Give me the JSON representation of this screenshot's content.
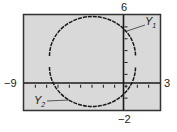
{
  "chart_data": {
    "type": "line",
    "title": "",
    "xlabel": "",
    "ylabel": "",
    "xlim": [
      -9,
      3
    ],
    "ylim": [
      -2,
      6
    ],
    "xscale": 1,
    "yscale": 1,
    "grid": false,
    "series": [
      {
        "name": "Y1",
        "description": "upper semicircle",
        "equation": "y = 2 + sqrt(16 - (x + 3)^2)"
      },
      {
        "name": "Y2",
        "description": "lower semicircle",
        "equation": "y = 2 - sqrt(16 - (x + 3)^2)"
      }
    ],
    "circle": {
      "center": [
        -3,
        2
      ],
      "radius": 4
    }
  },
  "labels": {
    "xmin": "−9",
    "xmax": "3",
    "ymax": "6",
    "ymin": "−2",
    "y1_main": "Y",
    "y1_sub": "1",
    "y2_main": "Y",
    "y2_sub": "2"
  },
  "colors": {
    "screen_bg": "#d9d9d9",
    "frame": "#333333",
    "curve": "#1a1a1a",
    "axes": "#1a1a1a"
  }
}
